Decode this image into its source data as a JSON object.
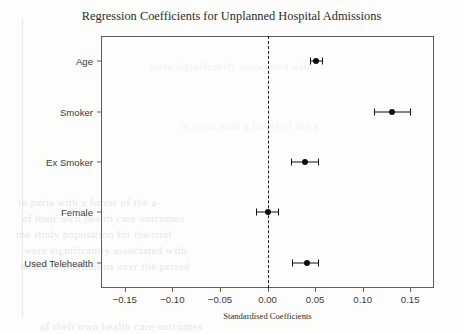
{
  "chart_data": {
    "type": "scatter",
    "subtype": "forest-plot-coefficient-plot",
    "title": "Regression Coefficients for Unplanned Hospital Admissions",
    "xlabel": "Standardised Coefficients",
    "ylabel": "",
    "xlim": [
      -0.175,
      0.175
    ],
    "xticks": [
      -0.15,
      -0.1,
      -0.05,
      0.0,
      0.05,
      0.1,
      0.15
    ],
    "xtick_labels": [
      "−0.15",
      "−0.10",
      "−0.05",
      "0.00",
      "0.05",
      "0.10",
      "0.15"
    ],
    "categories": [
      "Age",
      "Smoker",
      "Ex Smoker",
      "Female",
      "Used Telehealth"
    ],
    "grid": false,
    "legend": null,
    "reference_line": {
      "value": 0.0,
      "style": "dashed",
      "color": "#1c1c1c"
    },
    "marker_color": "#0d0d0d",
    "errorbar_color": "#111111",
    "points": [
      {
        "label": "Age",
        "value": 0.051,
        "ci_low": 0.045,
        "ci_high": 0.057
      },
      {
        "label": "Smoker",
        "value": 0.131,
        "ci_low": 0.112,
        "ci_high": 0.15
      },
      {
        "label": "Ex Smoker",
        "value": 0.039,
        "ci_low": 0.025,
        "ci_high": 0.053
      },
      {
        "label": "Female",
        "value": 0.0,
        "ci_low": -0.012,
        "ci_high": 0.011
      },
      {
        "label": "Used Telehealth",
        "value": 0.042,
        "ci_low": 0.026,
        "ci_high": 0.053
      }
    ]
  },
  "background_artifacts": {
    "note_lines": [
      "in  peris  with  a  forest  of  the  a-",
      "of  their  own  health  care  outcomes",
      "the  study  population  for  the  trial",
      "were  significantly  associated  with",
      "hospital  admissions  over  the  period"
    ]
  }
}
